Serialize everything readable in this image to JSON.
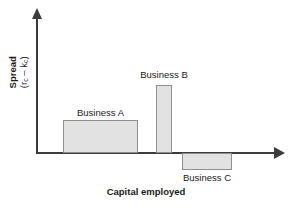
{
  "chart_data": {
    "type": "bar",
    "title": "",
    "xlabel": "Capital employed",
    "ylabel_main": "Spread",
    "ylabel_formula_open": "(r",
    "ylabel_formula_sub1": "c",
    "ylabel_formula_mid": " – k",
    "ylabel_formula_sub2": "c",
    "ylabel_formula_close": ")",
    "categories": [
      "Business A",
      "Business B",
      "Business C"
    ],
    "values": [
      1.0,
      2.1,
      -0.5
    ],
    "widths": [
      75,
      16,
      50
    ],
    "grid": false,
    "legend": "none",
    "axis_style": "arrow",
    "xlim": [
      0,
      1
    ],
    "ylim": [
      -0.7,
      2.6
    ],
    "bars": [
      {
        "label": "Business A",
        "value": 1.0,
        "sign": "positive",
        "label_position": "above",
        "x": 63,
        "y": 120,
        "width": 75,
        "height": 33,
        "label_x": 63,
        "label_y": 107,
        "label_width": 75
      },
      {
        "label": "Business B",
        "value": 2.1,
        "sign": "positive",
        "label_position": "above",
        "x": 156,
        "y": 85,
        "width": 16,
        "height": 68,
        "label_x": 126,
        "label_y": 69,
        "label_width": 76
      },
      {
        "label": "Business C",
        "value": -0.5,
        "sign": "negative",
        "label_position": "below",
        "x": 182,
        "y": 153,
        "width": 50,
        "height": 17,
        "label_x": 169,
        "label_y": 172,
        "label_width": 76
      }
    ]
  },
  "style": {
    "bar_fill": "#e2e2e2",
    "bar_stroke": "#8f8f8f",
    "axis_color": "#3c3c3c",
    "text_color": "#1a1a1a",
    "background": "#ffffff"
  }
}
